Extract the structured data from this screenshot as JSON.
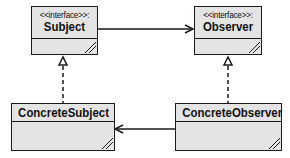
{
  "diagram": {
    "type": "uml-class-diagram",
    "classes": [
      {
        "id": "subject",
        "stereotype": "<<interface>>:",
        "name": "Subject"
      },
      {
        "id": "observer",
        "stereotype": "<<interface>>:",
        "name": "Observer"
      },
      {
        "id": "concrete_subject",
        "stereotype": "",
        "name": "ConcreteSubject"
      },
      {
        "id": "concrete_observer",
        "stereotype": "",
        "name": "ConcreteObserver"
      }
    ],
    "relations": [
      {
        "from": "Subject",
        "to": "Observer",
        "type": "association",
        "arrow": "open"
      },
      {
        "from": "ConcreteSubject",
        "to": "Subject",
        "type": "realization",
        "arrow": "hollow-triangle",
        "line": "dashed"
      },
      {
        "from": "ConcreteObserver",
        "to": "Observer",
        "type": "realization",
        "arrow": "hollow-triangle",
        "line": "dashed"
      },
      {
        "from": "ConcreteObserver",
        "to": "ConcreteSubject",
        "type": "association",
        "arrow": "open"
      }
    ],
    "colors": {
      "box_fill": "#e4e4e4",
      "line": "#1a1a1a",
      "background": "#ffffff"
    }
  }
}
